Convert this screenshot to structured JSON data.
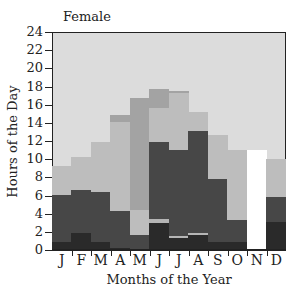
{
  "chart_data": {
    "type": "bar",
    "stacked": true,
    "title": "Female",
    "xlabel": "Months of the Year",
    "ylabel": "Hours of the Day",
    "ylim": [
      0,
      24
    ],
    "yticks": [
      0,
      2,
      4,
      6,
      8,
      10,
      12,
      14,
      16,
      18,
      20,
      22,
      24
    ],
    "categories": [
      "J",
      "F",
      "M",
      "A",
      "M",
      "J",
      "J",
      "A",
      "S",
      "O",
      "N",
      "D"
    ],
    "grid": false,
    "legend": null,
    "layer_colors": {
      "darkest": "#2a2a2a",
      "dark": "#474747",
      "thin_band": "#b5b5b5",
      "light_mid": "#bdbdbd",
      "medium_gray": "#a3a3a3",
      "missing": "#ffffff",
      "background": "#dcdcdc"
    },
    "stacks": [
      {
        "month": "J",
        "segments": [
          {
            "layer": "darkest",
            "from": 0,
            "to": 0.8
          },
          {
            "layer": "dark",
            "from": 0.8,
            "to": 6.0
          },
          {
            "layer": "light_mid",
            "from": 6.0,
            "to": 9.2
          }
        ]
      },
      {
        "month": "F",
        "segments": [
          {
            "layer": "darkest",
            "from": 0,
            "to": 1.8
          },
          {
            "layer": "dark",
            "from": 1.8,
            "to": 6.5
          },
          {
            "layer": "light_mid",
            "from": 6.5,
            "to": 10.2
          }
        ]
      },
      {
        "month": "M",
        "segments": [
          {
            "layer": "darkest",
            "from": 0,
            "to": 0.8
          },
          {
            "layer": "dark",
            "from": 0.8,
            "to": 6.3
          },
          {
            "layer": "light_mid",
            "from": 6.3,
            "to": 11.8
          }
        ]
      },
      {
        "month": "A",
        "segments": [
          {
            "layer": "darkest",
            "from": 0,
            "to": 0.2
          },
          {
            "layer": "dark",
            "from": 0.2,
            "to": 4.2
          },
          {
            "layer": "light_mid",
            "from": 4.2,
            "to": 14.0
          },
          {
            "layer": "medium_gray",
            "from": 14.0,
            "to": 14.8
          }
        ]
      },
      {
        "month": "M",
        "segments": [
          {
            "layer": "dark",
            "from": 0,
            "to": 1.6
          },
          {
            "layer": "light_mid",
            "from": 1.6,
            "to": 4.3
          },
          {
            "layer": "medium_gray",
            "from": 4.3,
            "to": 16.7
          }
        ]
      },
      {
        "month": "J",
        "segments": [
          {
            "layer": "darkest",
            "from": 0,
            "to": 2.9
          },
          {
            "layer": "thin_band",
            "from": 2.9,
            "to": 3.4
          },
          {
            "layer": "dark",
            "from": 3.4,
            "to": 11.8
          },
          {
            "layer": "light_mid",
            "from": 11.8,
            "to": 15.6
          },
          {
            "layer": "medium_gray",
            "from": 15.6,
            "to": 17.7
          }
        ]
      },
      {
        "month": "J",
        "segments": [
          {
            "layer": "darkest",
            "from": 0,
            "to": 1.3
          },
          {
            "layer": "thin_band",
            "from": 1.3,
            "to": 1.5
          },
          {
            "layer": "dark",
            "from": 1.5,
            "to": 11.0
          },
          {
            "layer": "light_mid",
            "from": 11.0,
            "to": 17.2
          },
          {
            "layer": "medium_gray",
            "from": 17.2,
            "to": 17.5
          }
        ]
      },
      {
        "month": "A",
        "segments": [
          {
            "layer": "darkest",
            "from": 0,
            "to": 1.6
          },
          {
            "layer": "thin_band",
            "from": 1.6,
            "to": 1.8
          },
          {
            "layer": "dark",
            "from": 1.8,
            "to": 13.0
          },
          {
            "layer": "light_mid",
            "from": 13.0,
            "to": 15.1
          }
        ]
      },
      {
        "month": "S",
        "segments": [
          {
            "layer": "darkest",
            "from": 0,
            "to": 0.8
          },
          {
            "layer": "dark",
            "from": 0.8,
            "to": 7.8
          },
          {
            "layer": "light_mid",
            "from": 7.8,
            "to": 12.6
          }
        ]
      },
      {
        "month": "O",
        "segments": [
          {
            "layer": "darkest",
            "from": 0,
            "to": 0.8
          },
          {
            "layer": "dark",
            "from": 0.8,
            "to": 3.3
          },
          {
            "layer": "light_mid",
            "from": 3.3,
            "to": 11.0
          }
        ]
      },
      {
        "month": "N",
        "segments": [
          {
            "layer": "missing",
            "from": 0,
            "to": 11.0
          }
        ]
      },
      {
        "month": "D",
        "segments": [
          {
            "layer": "darkest",
            "from": 0,
            "to": 3.0
          },
          {
            "layer": "dark",
            "from": 3.0,
            "to": 5.8
          },
          {
            "layer": "light_mid",
            "from": 5.8,
            "to": 10.0
          }
        ]
      }
    ]
  }
}
